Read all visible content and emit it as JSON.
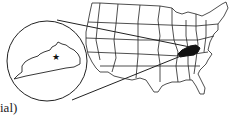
{
  "map": {
    "title": "United States map with Kentucky highlighted",
    "highlighted_region": "Kentucky",
    "inset": {
      "region": "Kentucky",
      "marker": "star-icon",
      "marker_meaning": "state capital"
    },
    "colors": {
      "outline": "#222222",
      "highlight": "#111111",
      "background": "#ffffff"
    }
  },
  "caption": {
    "text": "ial)"
  }
}
